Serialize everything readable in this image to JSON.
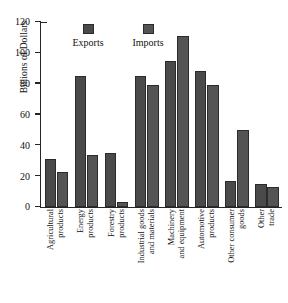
{
  "chart_data": {
    "type": "bar",
    "title": "",
    "xlabel": "",
    "ylabel": "Billions of Dollars",
    "ylim": [
      0,
      120
    ],
    "yticks": [
      0,
      20,
      40,
      60,
      80,
      100,
      120
    ],
    "ytick_labels": [
      "0",
      "20",
      "40",
      "60",
      "80",
      "100",
      "120"
    ],
    "grid": false,
    "legend_position": "top",
    "categories": [
      "Agricultural products",
      "Energy products",
      "Forestry products",
      "Industrial goods and materials",
      "Machinery and equipment",
      "Automotive products",
      "Other consumer goods",
      "Other trade"
    ],
    "category_lines": [
      [
        "Agricultural",
        "products"
      ],
      [
        "Energy",
        "products"
      ],
      [
        "Forestry",
        "products"
      ],
      [
        "Industrial goods",
        "and materials"
      ],
      [
        "Machinery",
        "and equipment"
      ],
      [
        "Automotive",
        "products"
      ],
      [
        "Other consumer",
        "goods"
      ],
      [
        "Other",
        "trade"
      ]
    ],
    "series": [
      {
        "name": "Exports",
        "color": "#4a4a4a",
        "values": [
          31,
          85,
          35,
          85,
          95,
          88,
          17,
          15
        ]
      },
      {
        "name": "Imports",
        "color": "#545454",
        "values": [
          23,
          34,
          3,
          79,
          111,
          79,
          50,
          13
        ]
      }
    ]
  }
}
